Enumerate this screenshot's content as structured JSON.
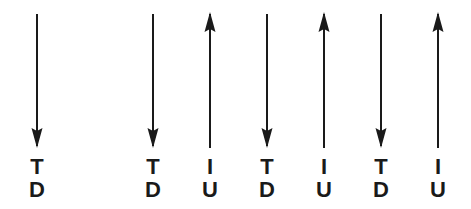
{
  "figure": {
    "background_color": "#ffffff",
    "stroke_color": "#1a1a1a",
    "width": 471,
    "height": 209
  },
  "arrows": [
    {
      "index": 1,
      "direction": "down",
      "icon": "arrow-down-icon",
      "x": 37,
      "shaft_top": 14,
      "shaft_bottom": 148,
      "label_top": "T",
      "label_bottom": "D"
    },
    {
      "index": 2,
      "direction": "down",
      "icon": "arrow-down-icon",
      "x": 153,
      "shaft_top": 14,
      "shaft_bottom": 148,
      "label_top": "T",
      "label_bottom": "D"
    },
    {
      "index": 3,
      "direction": "up",
      "icon": "arrow-up-icon",
      "x": 210,
      "shaft_top": 12,
      "shaft_bottom": 148,
      "label_top": "I",
      "label_bottom": "U"
    },
    {
      "index": 4,
      "direction": "down",
      "icon": "arrow-down-icon",
      "x": 267,
      "shaft_top": 14,
      "shaft_bottom": 148,
      "label_top": "T",
      "label_bottom": "D"
    },
    {
      "index": 5,
      "direction": "up",
      "icon": "arrow-up-icon",
      "x": 324,
      "shaft_top": 12,
      "shaft_bottom": 148,
      "label_top": "I",
      "label_bottom": "U"
    },
    {
      "index": 6,
      "direction": "down",
      "icon": "arrow-down-icon",
      "x": 381,
      "shaft_top": 14,
      "shaft_bottom": 148,
      "label_top": "T",
      "label_bottom": "D"
    },
    {
      "index": 7,
      "direction": "up",
      "icon": "arrow-up-icon",
      "x": 438,
      "shaft_top": 12,
      "shaft_bottom": 148,
      "label_top": "I",
      "label_bottom": "U"
    }
  ]
}
